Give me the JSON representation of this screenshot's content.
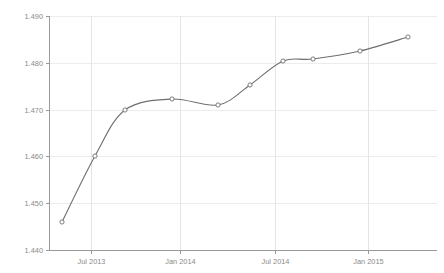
{
  "chart_data": {
    "type": "line",
    "title": "",
    "subtitle": "",
    "xlabel": "",
    "ylabel": "",
    "grid": true,
    "legend": "none",
    "ylim": [
      1.44,
      1.49
    ],
    "y_ticks": [
      "1.440",
      "1.450",
      "1.460",
      "1.470",
      "1.480",
      "1.490"
    ],
    "y_tick_values": [
      1.44,
      1.45,
      1.46,
      1.47,
      1.48,
      1.49
    ],
    "x_ticks": [
      "Jul 2013",
      "Jan 2014",
      "Jul 2014",
      "Jan 2015"
    ],
    "x_tick_values": [
      6,
      12,
      18,
      24
    ],
    "xlim": [
      3.5,
      30
    ],
    "x": [
      4.2,
      6.3,
      8.3,
      11.3,
      14.2,
      16.3,
      18.4,
      20.3,
      23.4,
      26.5
    ],
    "values": [
      1.446,
      1.46,
      1.469,
      1.472,
      1.471,
      1.4745,
      1.48,
      1.481,
      1.482,
      1.485
    ],
    "series": [
      {
        "name": "",
        "values": [
          1.446,
          1.46,
          1.469,
          1.472,
          1.471,
          1.4745,
          1.48,
          1.481,
          1.482,
          1.485
        ]
      }
    ],
    "colors": {
      "line": "#6e6e6e",
      "marker_fill": "#ffffff",
      "marker_stroke": "#6e6e6e",
      "gridline": "#ececec",
      "axis": "#9a9a9a",
      "tick_text": "#8a8a8a",
      "background": "#ffffff"
    }
  },
  "plot_geometry": {
    "left": 49,
    "right": 437,
    "top": 17,
    "bottom": 250,
    "y_gridline_pixels": [
      250,
      203,
      156,
      109.5,
      62.5,
      16
    ],
    "x_gridline_pixels": [
      91,
      180,
      275,
      368
    ],
    "point_pixels": [
      [
        62,
        222
      ],
      [
        95,
        156
      ],
      [
        125,
        110
      ],
      [
        172,
        99
      ],
      [
        218,
        105
      ],
      [
        250,
        85
      ],
      [
        283,
        61
      ],
      [
        313,
        59
      ],
      [
        360,
        51
      ],
      [
        408,
        37
      ]
    ]
  }
}
